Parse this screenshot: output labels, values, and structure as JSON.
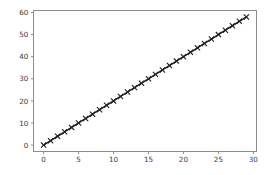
{
  "chart_data": {
    "type": "line",
    "title": "",
    "xlabel": "",
    "ylabel": "",
    "xlim": [
      -1.45,
      30.45
    ],
    "ylim": [
      -2.9,
      60.9
    ],
    "grid": false,
    "legend": null,
    "line_color": "#1f1f1f",
    "marker": "x",
    "marker_color": "#1f1f1f",
    "spine_color": "#8d8d8d",
    "background_color": "#ffffff",
    "xticks": [
      0,
      5,
      10,
      15,
      20,
      25,
      30
    ],
    "xtick_labels": [
      "0",
      "5",
      "10",
      "15",
      "20",
      "25",
      "30"
    ],
    "yticks": [
      0,
      10,
      20,
      30,
      40,
      50,
      60
    ],
    "ytick_labels": [
      "0",
      "10",
      "20",
      "30",
      "40",
      "50",
      "60"
    ],
    "series": [
      {
        "name": "series-1",
        "x": [
          0,
          1,
          2,
          3,
          4,
          5,
          6,
          7,
          8,
          9,
          10,
          11,
          12,
          13,
          14,
          15,
          16,
          17,
          18,
          19,
          20,
          21,
          22,
          23,
          24,
          25,
          26,
          27,
          28,
          29
        ],
        "values": [
          0,
          2,
          4,
          6,
          8,
          10,
          12,
          14,
          16,
          18,
          20,
          22,
          24,
          26,
          28,
          30,
          32,
          34,
          36,
          38,
          40,
          42,
          44,
          46,
          48,
          50,
          52,
          54,
          56,
          58
        ]
      }
    ]
  }
}
